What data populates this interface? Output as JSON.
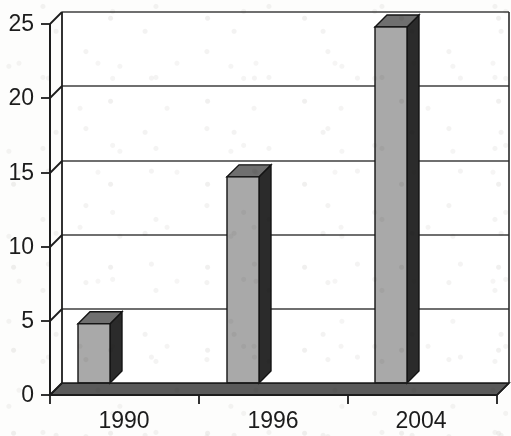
{
  "chart_data": {
    "type": "bar",
    "title": "",
    "subtitle": "",
    "xlabel": "",
    "ylabel": "",
    "categories": [
      "1990",
      "1996",
      "2004"
    ],
    "values": [
      4.8,
      14.7,
      24.8
    ],
    "series": [
      {
        "name": "",
        "values": [
          4.8,
          14.7,
          24.8
        ]
      }
    ],
    "ylim": [
      0,
      25
    ],
    "xlim": [
      0,
      3
    ],
    "y_ticks": [
      0,
      5,
      10,
      15,
      20,
      25
    ],
    "y_tick_labels": [
      "0",
      "5",
      "10",
      "15",
      "20",
      "25"
    ],
    "x_tick_labels": [
      "1990",
      "1996",
      "2004"
    ],
    "grid": true,
    "grid_axis": "y",
    "legend": false,
    "legend_position": "none",
    "annotations": [],
    "style": "3d-column",
    "bar_face_color": "#a9a9a9",
    "bar_side_color": "#2b2b2b",
    "bar_top_color": "#6e6e6e",
    "plot_background_color": "#ffffff",
    "floor_color": "#555555",
    "axis_color": "#1c1c1c",
    "grid_color": "#4a4a4a",
    "text_color": "#1c1c1c"
  },
  "geometry": {
    "plot_left": 50,
    "plot_right": 497,
    "plot_baseline_y": 395,
    "plot_top_y": 24,
    "depth_dx": 12,
    "depth_dy": -12,
    "bar_width": 32,
    "bar_centers": [
      94,
      243,
      391
    ]
  }
}
